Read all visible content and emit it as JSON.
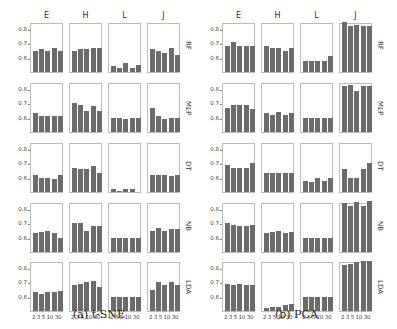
{
  "captions": {
    "left": "(a) t-SNE",
    "right": "(b) PCA"
  },
  "columns": [
    "E",
    "H",
    "L",
    "J"
  ],
  "rows": [
    "RF",
    "MLP",
    "DT",
    "NB",
    "LDA"
  ],
  "x_ticks": [
    "2",
    "3",
    "5",
    "10",
    "30"
  ],
  "y_ticks": [
    "0.6",
    "0.7",
    "0.8"
  ],
  "colors": {
    "bar": "#6b6b6b",
    "frame": "#bcbcbc"
  },
  "chart_data": [
    {
      "type": "bar",
      "title": "(a) t-SNE",
      "grid": "5 rows (classifier) x 4 columns (dataset)",
      "row_labels": [
        "RF",
        "MLP",
        "DT",
        "NB",
        "LDA"
      ],
      "col_labels": [
        "E",
        "H",
        "L",
        "J"
      ],
      "categories": [
        "2",
        "3",
        "5",
        "10",
        "30"
      ],
      "ylim": [
        0.5,
        0.85
      ],
      "yticks": [
        0.6,
        0.7,
        0.8
      ],
      "values": {
        "RF": {
          "E": [
            0.65,
            0.66,
            0.65,
            0.67,
            0.65
          ],
          "H": [
            0.65,
            0.66,
            0.66,
            0.67,
            0.67
          ],
          "L": [
            0.54,
            0.53,
            0.56,
            0.53,
            0.55
          ],
          "J": [
            0.66,
            0.65,
            0.63,
            0.67,
            0.62
          ]
        },
        "MLP": {
          "E": [
            0.63,
            0.61,
            0.61,
            0.61,
            0.61
          ],
          "H": [
            0.7,
            0.69,
            0.65,
            0.68,
            0.65
          ],
          "L": [
            0.6,
            0.6,
            0.59,
            0.6,
            0.6
          ],
          "J": [
            0.67,
            0.61,
            0.59,
            0.6,
            0.6
          ]
        },
        "DT": {
          "E": [
            0.62,
            0.6,
            0.6,
            0.59,
            0.62
          ],
          "H": [
            0.67,
            0.66,
            0.66,
            0.68,
            0.63
          ],
          "L": [
            0.52,
            0.51,
            0.52,
            0.52,
            0.5
          ],
          "J": [
            0.62,
            0.62,
            0.62,
            0.61,
            0.62
          ]
        },
        "NB": {
          "E": [
            0.63,
            0.64,
            0.65,
            0.63,
            0.6
          ],
          "H": [
            0.7,
            0.7,
            0.65,
            0.68,
            0.68
          ],
          "L": [
            0.6,
            0.6,
            0.6,
            0.6,
            0.6
          ],
          "J": [
            0.65,
            0.67,
            0.65,
            0.66,
            0.66
          ]
        },
        "LDA": {
          "E": [
            0.63,
            0.62,
            0.63,
            0.63,
            0.64
          ],
          "H": [
            0.68,
            0.69,
            0.7,
            0.71,
            0.67
          ],
          "L": [
            0.6,
            0.6,
            0.6,
            0.6,
            0.6
          ],
          "J": [
            0.65,
            0.7,
            0.68,
            0.7,
            0.68
          ]
        }
      }
    },
    {
      "type": "bar",
      "title": "(b) PCA",
      "grid": "5 rows (classifier) x 4 columns (dataset)",
      "row_labels": [
        "RF",
        "MLP",
        "DT",
        "NB",
        "LDA"
      ],
      "col_labels": [
        "E",
        "H",
        "L",
        "J"
      ],
      "categories": [
        "2",
        "3",
        "5",
        "10",
        "30"
      ],
      "ylim": [
        0.5,
        0.85
      ],
      "yticks": [
        0.6,
        0.7,
        0.8
      ],
      "values": {
        "RF": {
          "E": [
            0.68,
            0.71,
            0.68,
            0.68,
            0.68
          ],
          "H": [
            0.68,
            0.67,
            0.67,
            0.65,
            0.67
          ],
          "L": [
            0.58,
            0.58,
            0.58,
            0.58,
            0.61
          ],
          "J": [
            0.85,
            0.82,
            0.83,
            0.82,
            0.82
          ]
        },
        "MLP": {
          "E": [
            0.67,
            0.69,
            0.69,
            0.69,
            0.66
          ],
          "H": [
            0.63,
            0.62,
            0.64,
            0.62,
            0.63
          ],
          "L": [
            0.6,
            0.6,
            0.6,
            0.6,
            0.6
          ],
          "J": [
            0.82,
            0.83,
            0.79,
            0.82,
            0.82
          ]
        },
        "DT": {
          "E": [
            0.69,
            0.67,
            0.67,
            0.67,
            0.7
          ],
          "H": [
            0.63,
            0.63,
            0.63,
            0.63,
            0.63
          ],
          "L": [
            0.58,
            0.57,
            0.6,
            0.58,
            0.6
          ],
          "J": [
            0.66,
            0.6,
            0.6,
            0.66,
            0.7
          ]
        },
        "NB": {
          "E": [
            0.7,
            0.69,
            0.68,
            0.68,
            0.69
          ],
          "H": [
            0.63,
            0.64,
            0.65,
            0.63,
            0.64
          ],
          "L": [
            0.6,
            0.6,
            0.6,
            0.6,
            0.6
          ],
          "J": [
            0.84,
            0.82,
            0.85,
            0.82,
            0.86
          ]
        },
        "LDA": {
          "E": [
            0.69,
            0.68,
            0.69,
            0.68,
            0.68
          ],
          "H": [
            0.52,
            0.53,
            0.53,
            0.54,
            0.55
          ],
          "L": [
            0.6,
            0.6,
            0.6,
            0.6,
            0.6
          ],
          "J": [
            0.82,
            0.83,
            0.84,
            0.85,
            0.85
          ]
        }
      }
    }
  ]
}
